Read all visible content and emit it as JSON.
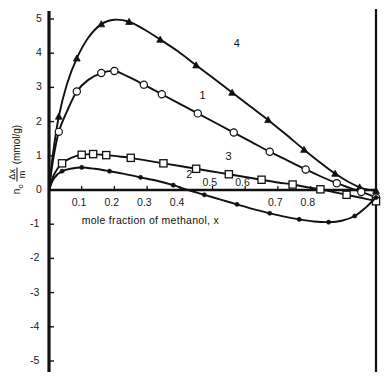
{
  "chart_data": {
    "type": "line",
    "title": "",
    "xlabel": "mole fraction of methanol, x",
    "ylabel": "n_o Δx/m (mmol/g)",
    "ylabel_parts": {
      "n": "n",
      "n_sub": "o",
      "numerator": "Δx",
      "denominator": "m",
      "units": "(mmol/g)"
    },
    "xlim": [
      0,
      1
    ],
    "ylim": [
      -5,
      5
    ],
    "grid": false,
    "legend_position": "inline-curve-labels",
    "xticks": [
      0.1,
      0.2,
      0.3,
      0.4,
      0.5,
      0.6,
      0.7,
      0.8
    ],
    "xtick_labels": [
      "0.1",
      "0.2",
      "0.3",
      "0.4",
      "0.5",
      "0.6",
      "0.7",
      "0.8"
    ],
    "yticks": [
      5,
      4,
      3,
      2,
      1,
      0,
      -1,
      -2,
      -3,
      -4,
      -5
    ],
    "ytick_labels": [
      "5",
      "4",
      "3",
      "2",
      "1",
      "0",
      "-1",
      "-2",
      "-3",
      "-4",
      "-5"
    ],
    "series": [
      {
        "name": "4",
        "label": "4",
        "marker": "filled-triangle",
        "label_x": 0.565,
        "label_y": 4.25,
        "x": [
          0.0,
          0.012,
          0.03,
          0.055,
          0.085,
          0.12,
          0.16,
          0.2,
          0.245,
          0.29,
          0.34,
          0.395,
          0.45,
          0.505,
          0.56,
          0.615,
          0.67,
          0.725,
          0.78,
          0.83,
          0.875,
          0.915,
          0.95,
          0.975,
          1.0
        ],
        "y": [
          0.0,
          1.05,
          2.15,
          3.1,
          3.85,
          4.45,
          4.85,
          4.98,
          4.92,
          4.7,
          4.4,
          4.05,
          3.65,
          3.25,
          2.85,
          2.45,
          2.05,
          1.62,
          1.18,
          0.8,
          0.48,
          0.24,
          0.08,
          0.01,
          -0.02
        ],
        "marker_x": [
          0.03,
          0.085,
          0.16,
          0.245,
          0.34,
          0.45,
          0.56,
          0.67,
          0.78,
          0.875,
          0.95,
          1.0
        ],
        "marker_y": [
          2.15,
          3.85,
          4.85,
          4.92,
          4.4,
          3.65,
          2.85,
          2.05,
          1.18,
          0.48,
          0.08,
          -0.02
        ]
      },
      {
        "name": "1",
        "label": "1",
        "marker": "open-circle",
        "label_x": 0.46,
        "label_y": 2.72,
        "x": [
          0.0,
          0.012,
          0.03,
          0.055,
          0.085,
          0.12,
          0.16,
          0.2,
          0.245,
          0.29,
          0.345,
          0.4,
          0.455,
          0.51,
          0.565,
          0.62,
          0.675,
          0.73,
          0.785,
          0.835,
          0.88,
          0.92,
          0.955,
          0.98,
          1.0
        ],
        "y": [
          0.0,
          0.85,
          1.7,
          2.3,
          2.88,
          3.22,
          3.42,
          3.48,
          3.3,
          3.08,
          2.8,
          2.52,
          2.24,
          1.96,
          1.68,
          1.4,
          1.12,
          0.86,
          0.6,
          0.38,
          0.2,
          0.06,
          -0.06,
          -0.14,
          -0.22
        ],
        "marker_x": [
          0.03,
          0.085,
          0.16,
          0.2,
          0.29,
          0.345,
          0.455,
          0.565,
          0.675,
          0.785,
          0.88,
          0.955,
          1.0
        ],
        "marker_y": [
          1.7,
          2.88,
          3.42,
          3.48,
          3.08,
          2.8,
          2.24,
          1.68,
          1.12,
          0.6,
          0.2,
          -0.06,
          -0.22
        ]
      },
      {
        "name": "3",
        "label": "3",
        "marker": "open-square",
        "label_x": 0.54,
        "label_y": 0.95,
        "x": [
          0.0,
          0.015,
          0.04,
          0.07,
          0.1,
          0.135,
          0.175,
          0.215,
          0.25,
          0.3,
          0.35,
          0.4,
          0.45,
          0.5,
          0.55,
          0.6,
          0.65,
          0.7,
          0.745,
          0.79,
          0.83,
          0.87,
          0.91,
          0.95,
          0.98,
          1.0
        ],
        "y": [
          0.0,
          0.45,
          0.78,
          0.95,
          1.03,
          1.05,
          1.02,
          0.98,
          0.94,
          0.86,
          0.78,
          0.7,
          0.62,
          0.54,
          0.46,
          0.38,
          0.3,
          0.22,
          0.16,
          0.08,
          0.02,
          -0.06,
          -0.14,
          -0.22,
          -0.28,
          -0.33
        ],
        "marker_x": [
          0.04,
          0.1,
          0.135,
          0.175,
          0.25,
          0.35,
          0.45,
          0.55,
          0.65,
          0.745,
          0.83,
          0.91,
          1.0
        ],
        "marker_y": [
          0.78,
          1.03,
          1.05,
          1.02,
          0.94,
          0.78,
          0.62,
          0.46,
          0.3,
          0.16,
          0.02,
          -0.14,
          -0.33
        ]
      },
      {
        "name": "2",
        "label": "2",
        "marker": "filled-dot",
        "label_x": 0.42,
        "label_y": 0.42,
        "x": [
          0.0,
          0.015,
          0.04,
          0.07,
          0.1,
          0.14,
          0.185,
          0.23,
          0.28,
          0.33,
          0.38,
          0.425,
          0.475,
          0.525,
          0.575,
          0.625,
          0.675,
          0.72,
          0.765,
          0.81,
          0.855,
          0.895,
          0.935,
          0.97,
          1.0
        ],
        "y": [
          0.0,
          0.34,
          0.55,
          0.63,
          0.66,
          0.62,
          0.55,
          0.47,
          0.37,
          0.27,
          0.14,
          0.0,
          -0.14,
          -0.28,
          -0.42,
          -0.56,
          -0.68,
          -0.78,
          -0.86,
          -0.92,
          -0.94,
          -0.9,
          -0.76,
          -0.5,
          -0.22
        ],
        "marker_x": [
          0.04,
          0.1,
          0.185,
          0.28,
          0.38,
          0.475,
          0.575,
          0.675,
          0.765,
          0.855,
          0.935,
          1.0
        ],
        "marker_y": [
          0.55,
          0.66,
          0.55,
          0.37,
          0.14,
          -0.14,
          -0.42,
          -0.68,
          -0.86,
          -0.94,
          -0.76,
          -0.22
        ]
      }
    ]
  },
  "axes": {
    "left_axis_name": "y-axis",
    "right_axis_name": "right-axis",
    "x_axis_name": "x-axis"
  }
}
